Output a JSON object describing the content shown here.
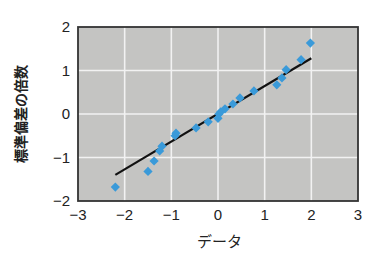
{
  "chart_data": {
    "type": "scatter",
    "title": "",
    "xlabel": "データ",
    "ylabel": "標準偏差の倍数",
    "xlim": [
      -3,
      3
    ],
    "ylim": [
      -2,
      2
    ],
    "xticks": [
      -3,
      -2,
      -1,
      0,
      1,
      2,
      3
    ],
    "yticks": [
      -2,
      -1,
      0,
      1,
      2
    ],
    "xtick_labels": [
      "−3",
      "−2",
      "−1",
      "0",
      "1",
      "2",
      "3"
    ],
    "ytick_labels": [
      "−2",
      "−1",
      "0",
      "1",
      "2"
    ],
    "grid": true,
    "legend": null,
    "series": [
      {
        "name": "data points",
        "marker": "diamond",
        "color": "#3a9ad9",
        "x": [
          -2.2,
          -1.5,
          -1.37,
          -1.25,
          -1.2,
          -0.92,
          -0.9,
          -0.47,
          -0.21,
          0.0,
          0.02,
          0.06,
          0.15,
          0.32,
          0.47,
          0.77,
          1.26,
          1.37,
          1.46,
          1.78,
          1.98
        ],
        "y": [
          -1.68,
          -1.32,
          -1.08,
          -0.85,
          -0.74,
          -0.5,
          -0.44,
          -0.32,
          -0.18,
          -0.1,
          0.0,
          0.05,
          0.12,
          0.23,
          0.37,
          0.53,
          0.67,
          0.83,
          1.02,
          1.25,
          1.63
        ]
      },
      {
        "name": "reference line",
        "type": "line",
        "color": "#111111",
        "x": [
          -2.2,
          2.0
        ],
        "y": [
          -1.4,
          1.28
        ]
      }
    ],
    "colors": {
      "plot_background": "#c4c4c2",
      "grid": "#f2f2f2",
      "frame": "#333333",
      "marker": "#3a9ad9",
      "line": "#111111"
    }
  }
}
